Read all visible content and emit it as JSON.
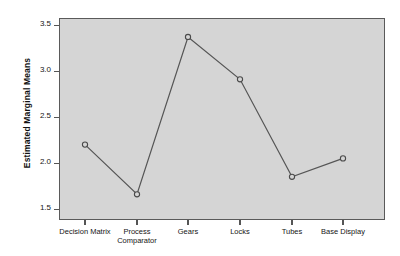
{
  "chart_data": {
    "type": "line",
    "title": "",
    "subtitle": "",
    "xlabel": "",
    "ylabel": "Estimated Marginal Means",
    "categories": [
      "Decision Matrix",
      "Process Comparator",
      "Gears",
      "Locks",
      "Tubes",
      "Base Display"
    ],
    "category_lines": [
      [
        "Decision Matrix"
      ],
      [
        "Process",
        "Comparator"
      ],
      [
        "Gears"
      ],
      [
        "Locks"
      ],
      [
        "Tubes"
      ],
      [
        "Base Display"
      ]
    ],
    "values": [
      2.2,
      1.66,
      3.37,
      2.91,
      1.85,
      2.05
    ],
    "series": [
      {
        "name": "Estimated Marginal Means",
        "values": [
          2.2,
          1.66,
          3.37,
          2.91,
          1.85,
          2.05
        ]
      }
    ],
    "ylim": [
      1.5,
      3.5
    ],
    "yticks": [
      1.5,
      2.0,
      2.5,
      3.0,
      3.5
    ],
    "ytick_labels": [
      "1.5",
      "2.0",
      "2.5",
      "3.0",
      "3.5"
    ],
    "grid": false,
    "legend": "none",
    "marker": "open-circle",
    "colors": {
      "plot_background": "#d5d5d5",
      "page_background": "#ffffff",
      "line": "#555555",
      "marker_stroke": "#4a4a4a",
      "marker_fill": "#d5d5d5",
      "axis": "#5a5a5a",
      "text": "#151515"
    }
  },
  "axes": {
    "y_title": "Estimated Marginal Means",
    "y_ticks": [
      {
        "label": "3.5",
        "value": 3.5
      },
      {
        "label": "3.0",
        "value": 3.0
      },
      {
        "label": "2.5",
        "value": 2.5
      },
      {
        "label": "2.0",
        "value": 2.0
      },
      {
        "label": "1.5",
        "value": 1.5
      }
    ],
    "x_ticks": [
      {
        "line1": "Decision Matrix",
        "line2": ""
      },
      {
        "line1": "Process",
        "line2": "Comparator"
      },
      {
        "line1": "Gears",
        "line2": ""
      },
      {
        "line1": "Locks",
        "line2": ""
      },
      {
        "line1": "Tubes",
        "line2": ""
      },
      {
        "line1": "Base Display",
        "line2": ""
      }
    ]
  }
}
